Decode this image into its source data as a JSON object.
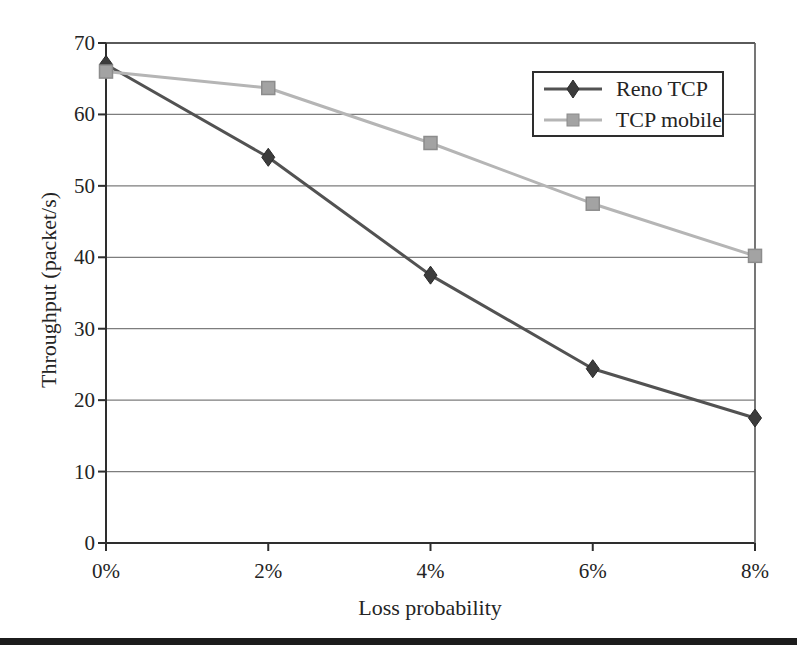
{
  "figure": {
    "kind": "scanned line chart figure"
  },
  "chart_data": {
    "type": "line",
    "x_categories": [
      "0%",
      "2%",
      "4%",
      "6%",
      "8%"
    ],
    "series": [
      {
        "name": "Reno TCP",
        "marker": "diamond",
        "line_color": "#525252",
        "marker_color": "#3c3c3c",
        "marker_edge": "#2a2a2a",
        "values": [
          67,
          54,
          37.5,
          24.4,
          17.5
        ]
      },
      {
        "name": "TCP mobile",
        "marker": "square",
        "line_color": "#b5b5b5",
        "marker_color": "#a3a3a3",
        "marker_edge": "#8c8c8c",
        "values": [
          66,
          63.7,
          56,
          47.5,
          40.2
        ]
      }
    ],
    "title": "",
    "xlabel": "Loss probability",
    "ylabel": "Throughput (packet/s)",
    "ylim": [
      0,
      70
    ],
    "ytick_step": 10,
    "y_ticks": [
      "0",
      "10",
      "20",
      "30",
      "40",
      "50",
      "60",
      "70"
    ],
    "grid": "horizontal",
    "legend_position": "top-right",
    "axis_color": "#2e2e2e",
    "grid_color": "#7d7d7d",
    "top_gridline_color": "#5a5a5a",
    "text_color": "#242424"
  }
}
